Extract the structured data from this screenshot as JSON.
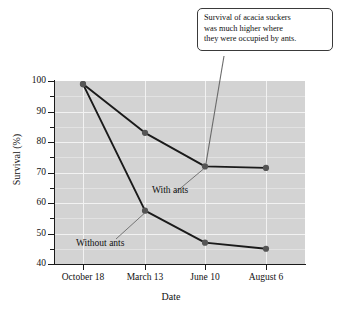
{
  "callout": {
    "lines": [
      "Survival of acacia suckers",
      "was much higher where",
      "they were occupied by ants."
    ]
  },
  "chart_data": {
    "type": "line",
    "title": "",
    "xlabel": "Date",
    "ylabel": "Survival (%)",
    "categories": [
      "October 18",
      "March 13",
      "June 10",
      "August 6"
    ],
    "series": [
      {
        "name": "With ants",
        "values": [
          99,
          83,
          72,
          71.5
        ]
      },
      {
        "name": "Without ants",
        "values": [
          99,
          57.5,
          47,
          45
        ]
      }
    ],
    "ylim": [
      40,
      100
    ],
    "yticks": [
      40,
      50,
      60,
      70,
      80,
      90,
      100
    ],
    "ytick_labels": [
      "40",
      "50",
      "60",
      "70",
      "80",
      "90",
      "100"
    ],
    "yminor_ticks": [
      45,
      55,
      65,
      75,
      85,
      95
    ],
    "grid": true,
    "legend": "inline-annotations",
    "plot_background": "#d3d3d3",
    "gridline_color": "#f2f2f2",
    "line_color": "#1a1a1a",
    "marker_color": "#555555",
    "annotations": [
      {
        "text": "With ants",
        "target": "June 10 with-ants point"
      },
      {
        "text": "Without ants",
        "target": "March 13 without-ants point"
      }
    ]
  }
}
